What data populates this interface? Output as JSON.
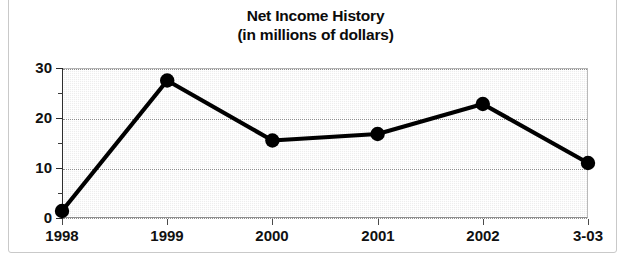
{
  "chart_data": {
    "type": "line",
    "title": "Net Income History",
    "subtitle": "(in millions of dollars)",
    "xlabel": "",
    "ylabel": "",
    "categories": [
      "1998",
      "1999",
      "2000",
      "2001",
      "2002",
      "3-03"
    ],
    "values": [
      1.4,
      27.5,
      15.5,
      16.8,
      22.8,
      11.0
    ],
    "series": [
      {
        "name": "Net Income",
        "values": [
          1.4,
          27.5,
          15.5,
          16.8,
          22.8,
          11.0
        ]
      }
    ],
    "ylim": [
      0,
      30
    ],
    "y_ticks": [
      0,
      10,
      20,
      30
    ],
    "y_tick_labels": [
      "0",
      "10",
      "20",
      "30"
    ],
    "y_minor_ticks": [
      5,
      15,
      25
    ],
    "grid": true,
    "grid_axis": "y",
    "grid_style": "dotted",
    "legend": false,
    "legend_position": "none",
    "marker": "filled-circle",
    "line_color": "#000000",
    "marker_color": "#000000",
    "plot_background": "#ededed"
  },
  "axis": {
    "y_labels": [
      "30",
      "20",
      "10",
      "0"
    ],
    "x_labels": [
      "1998",
      "1999",
      "2000",
      "2001",
      "2002",
      "3-03"
    ]
  },
  "colors": {
    "ink": "#0b0b0b",
    "plot_fill": "#ededed",
    "grid": "#8d8d8d",
    "frame": "#c9c9c9"
  }
}
